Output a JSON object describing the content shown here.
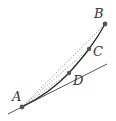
{
  "diagram": {
    "points": [
      {
        "id": "A",
        "label": "A",
        "x": 22,
        "y": 107,
        "label_x": 12,
        "label_y": 101
      },
      {
        "id": "B",
        "label": "B",
        "x": 105,
        "y": 24,
        "label_x": 94,
        "label_y": 18
      },
      {
        "id": "C",
        "label": "C",
        "x": 89,
        "y": 49,
        "label_x": 93,
        "label_y": 56
      },
      {
        "id": "D",
        "label": "D",
        "x": 69,
        "y": 73,
        "label_x": 73,
        "label_y": 85
      }
    ],
    "curve": {
      "from": "A",
      "to": "B",
      "style": "solid"
    },
    "tangent_line": {
      "at": "A",
      "x1": 8,
      "y1": 114,
      "x2": 107,
      "y2": 64,
      "style": "solid"
    },
    "secants": [
      {
        "from": "A",
        "to": "B",
        "style": "dotted"
      },
      {
        "from": "A",
        "to": "C",
        "style": "dotted"
      },
      {
        "from": "A",
        "to": "D",
        "style": "dotted"
      }
    ],
    "colors": {
      "curve": "#2a2a2a",
      "tangent": "#555555",
      "secant": "#999999",
      "point": "#555555",
      "label": "#333333"
    }
  }
}
